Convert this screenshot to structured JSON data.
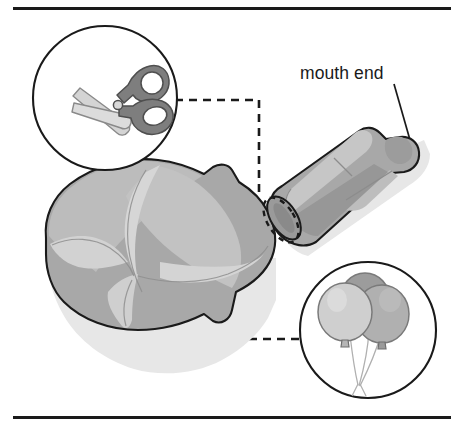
{
  "figure": {
    "background_color": "#ffffff",
    "rules": {
      "color": "#1a1a1a",
      "top_label": "top-rule",
      "bottom_label": "bottom-rule"
    }
  },
  "annotations": {
    "mouth_end_label": "mouth end"
  },
  "callouts": [
    {
      "id": "scissors",
      "icon_name": "scissors-icon",
      "position": "top-left",
      "meaning": "cut here"
    },
    {
      "id": "balloons",
      "icon_name": "balloons-icon",
      "position": "bottom-right",
      "meaning": "balloon material"
    }
  ],
  "colors": {
    "outline": "#1a1a1a",
    "balloon_light": "#c3c3c3",
    "balloon_mid": "#a8a8a8",
    "balloon_dark": "#8f8f8f",
    "balloon_darkest": "#7e7e7e",
    "highlight": "#d8d8d8",
    "shadow": "#e4e4e4",
    "scissor_handle": "#7e7e7e",
    "scissor_blade": "#d0d0d0",
    "balloon_a": "#cfcfcf",
    "balloon_b": "#9c9c9c",
    "balloon_c": "#b0b0b0",
    "string": "#b4b4b4",
    "dash": "#1a1a1a"
  },
  "objects": {
    "deflated_balloon": {
      "name": "deflated-balloon",
      "description": "flat deflated balloon body"
    },
    "rolled_balloon": {
      "name": "rolled-balloon-tube",
      "description": "rolled up balloon tube with cut end"
    },
    "cut_line": {
      "name": "cut-dashed-ellipse",
      "description": "dashed cut location on tube end"
    }
  }
}
